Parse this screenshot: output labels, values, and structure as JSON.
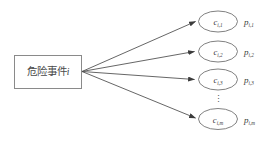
{
  "diagram": {
    "type": "fan-out-node-diagram",
    "background_color": "#ffffff",
    "stroke_color": "#5a5a5a",
    "text_color": "#3a3a3a",
    "source_node": {
      "label": "危险事件",
      "index_var": "i",
      "shape": "rectangle"
    },
    "vertical_ellipsis": "⋮",
    "branches": [
      {
        "consequence_base": "c",
        "consequence_sub": "i,1",
        "probability_base": "p",
        "probability_sub": "i,1"
      },
      {
        "consequence_base": "c",
        "consequence_sub": "i,2",
        "probability_base": "p",
        "probability_sub": "i,2"
      },
      {
        "consequence_base": "c",
        "consequence_sub": "i,3",
        "probability_base": "p",
        "probability_sub": "i,3"
      },
      {
        "consequence_base": "c",
        "consequence_sub": "i,m",
        "probability_base": "p",
        "probability_sub": "i,m"
      }
    ]
  }
}
